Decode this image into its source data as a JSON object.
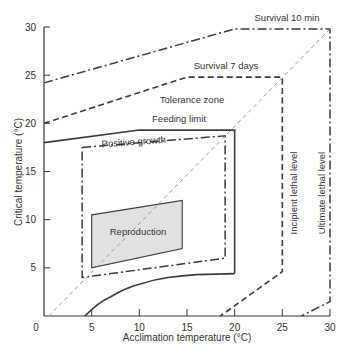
{
  "chart_data": {
    "type": "line",
    "title": "",
    "xlabel": "Acclimation temperature (°C)",
    "ylabel": "Critical temperature (°C)",
    "xlim": [
      0,
      30
    ],
    "ylim": [
      0,
      30
    ],
    "xticks": [
      0,
      5,
      10,
      15,
      20,
      25,
      30
    ],
    "yticks": [
      5,
      10,
      15,
      20,
      25,
      30
    ],
    "grid": false,
    "colors": {
      "line": "#3a3a3a",
      "diagonal": "#9a9a9a",
      "reproduction_fill": "#e2e2e2",
      "text": "#333333"
    },
    "series": [
      {
        "name": "Survival 10 min",
        "style": "dash-dot",
        "points": [
          [
            0,
            24.2
          ],
          [
            20,
            29.8
          ],
          [
            30,
            29.8
          ],
          [
            30,
            1.5
          ],
          [
            27,
            0
          ]
        ]
      },
      {
        "name": "Survival 7 days",
        "style": "dashed",
        "points": [
          [
            0,
            20
          ],
          [
            15,
            24.8
          ],
          [
            25,
            24.8
          ],
          [
            25,
            4.6
          ],
          [
            18.5,
            0
          ]
        ]
      },
      {
        "name": "Feeding limit",
        "style": "solid",
        "points": [
          [
            0,
            18
          ],
          [
            10,
            19.3
          ],
          [
            20,
            19.3
          ],
          [
            20,
            4.4
          ]
        ]
      },
      {
        "name": "Feeding limit lower boundary",
        "style": "solid",
        "points": [
          [
            4.3,
            0
          ],
          [
            7,
            2
          ],
          [
            10,
            3.3
          ],
          [
            13,
            4
          ],
          [
            16,
            4.3
          ],
          [
            20,
            4.4
          ]
        ]
      },
      {
        "name": "Positive growth",
        "style": "dash-dot",
        "points": [
          [
            4,
            17.5
          ],
          [
            19,
            18.7
          ],
          [
            19,
            6
          ],
          [
            4,
            4
          ],
          [
            4,
            17.5
          ]
        ]
      },
      {
        "name": "Reproduction",
        "style": "filled-polygon",
        "points": [
          [
            5,
            10.5
          ],
          [
            14.5,
            12
          ],
          [
            14.5,
            7
          ],
          [
            5,
            5
          ]
        ]
      },
      {
        "name": "Acclimation = critical (diagonal)",
        "style": "gray-dashed",
        "points": [
          [
            0.5,
            0
          ],
          [
            30,
            29.8
          ]
        ]
      }
    ],
    "annotations": [
      {
        "text": "Survival 10 min",
        "x": 25.5,
        "y": 30.8
      },
      {
        "text": "Survival 7 days",
        "x": 19,
        "y": 26.3
      },
      {
        "text": "Tolerance zone",
        "x": 15.5,
        "y": 22.3
      },
      {
        "text": "Feeding limit",
        "x": 14,
        "y": 20.3
      },
      {
        "text": "Positive growth",
        "x": 9.5,
        "y": 17.3
      },
      {
        "text": "Reproduction",
        "x": 9.7,
        "y": 8.5
      },
      {
        "text": "Incipient lethal level",
        "x": 26.3,
        "y": 13,
        "rotate": -90
      },
      {
        "text": "Ultimate lethal level",
        "x": 29.2,
        "y": 13,
        "rotate": -90
      }
    ]
  },
  "axes": {
    "x_label": "Acclimation temperature (°C)",
    "y_label": "Critical temperature (°C)",
    "x_tick_labels": [
      "0",
      "5",
      "10",
      "15",
      "20",
      "25",
      "30"
    ],
    "y_tick_labels": [
      "5",
      "10",
      "15",
      "20",
      "25",
      "30"
    ]
  },
  "labels": {
    "survival_10min": "Survival 10 min",
    "survival_7days": "Survival 7 days",
    "tolerance_zone": "Tolerance zone",
    "feeding_limit": "Feeding limit",
    "positive_growth": "Positive growth",
    "reproduction": "Reproduction",
    "incipient_lethal": "Incipient lethal level",
    "ultimate_lethal": "Ultimate lethal level"
  }
}
